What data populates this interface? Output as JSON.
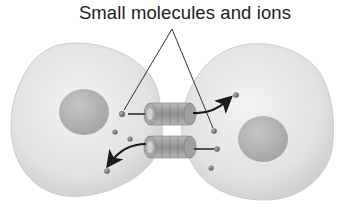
{
  "diagram": {
    "title": "Small molecules and ions",
    "cells": [
      {
        "name": "left-cell",
        "nucleus": true
      },
      {
        "name": "right-cell",
        "nucleus": true
      }
    ],
    "channels": [
      {
        "name": "upper-gap-junction-channel",
        "direction": "left-to-right"
      },
      {
        "name": "lower-gap-junction-channel",
        "direction": "right-to-left"
      }
    ],
    "colors": {
      "cell_fill": "#e4e4e4",
      "cell_edge": "#cfcfcf",
      "nucleus_fill": "#b5b5b5",
      "channel_fill": "#9a9a9a",
      "molecule": "#6a6a6a",
      "label_line": "#333333",
      "arrow": "#1a1a1a",
      "text": "#222222"
    }
  }
}
